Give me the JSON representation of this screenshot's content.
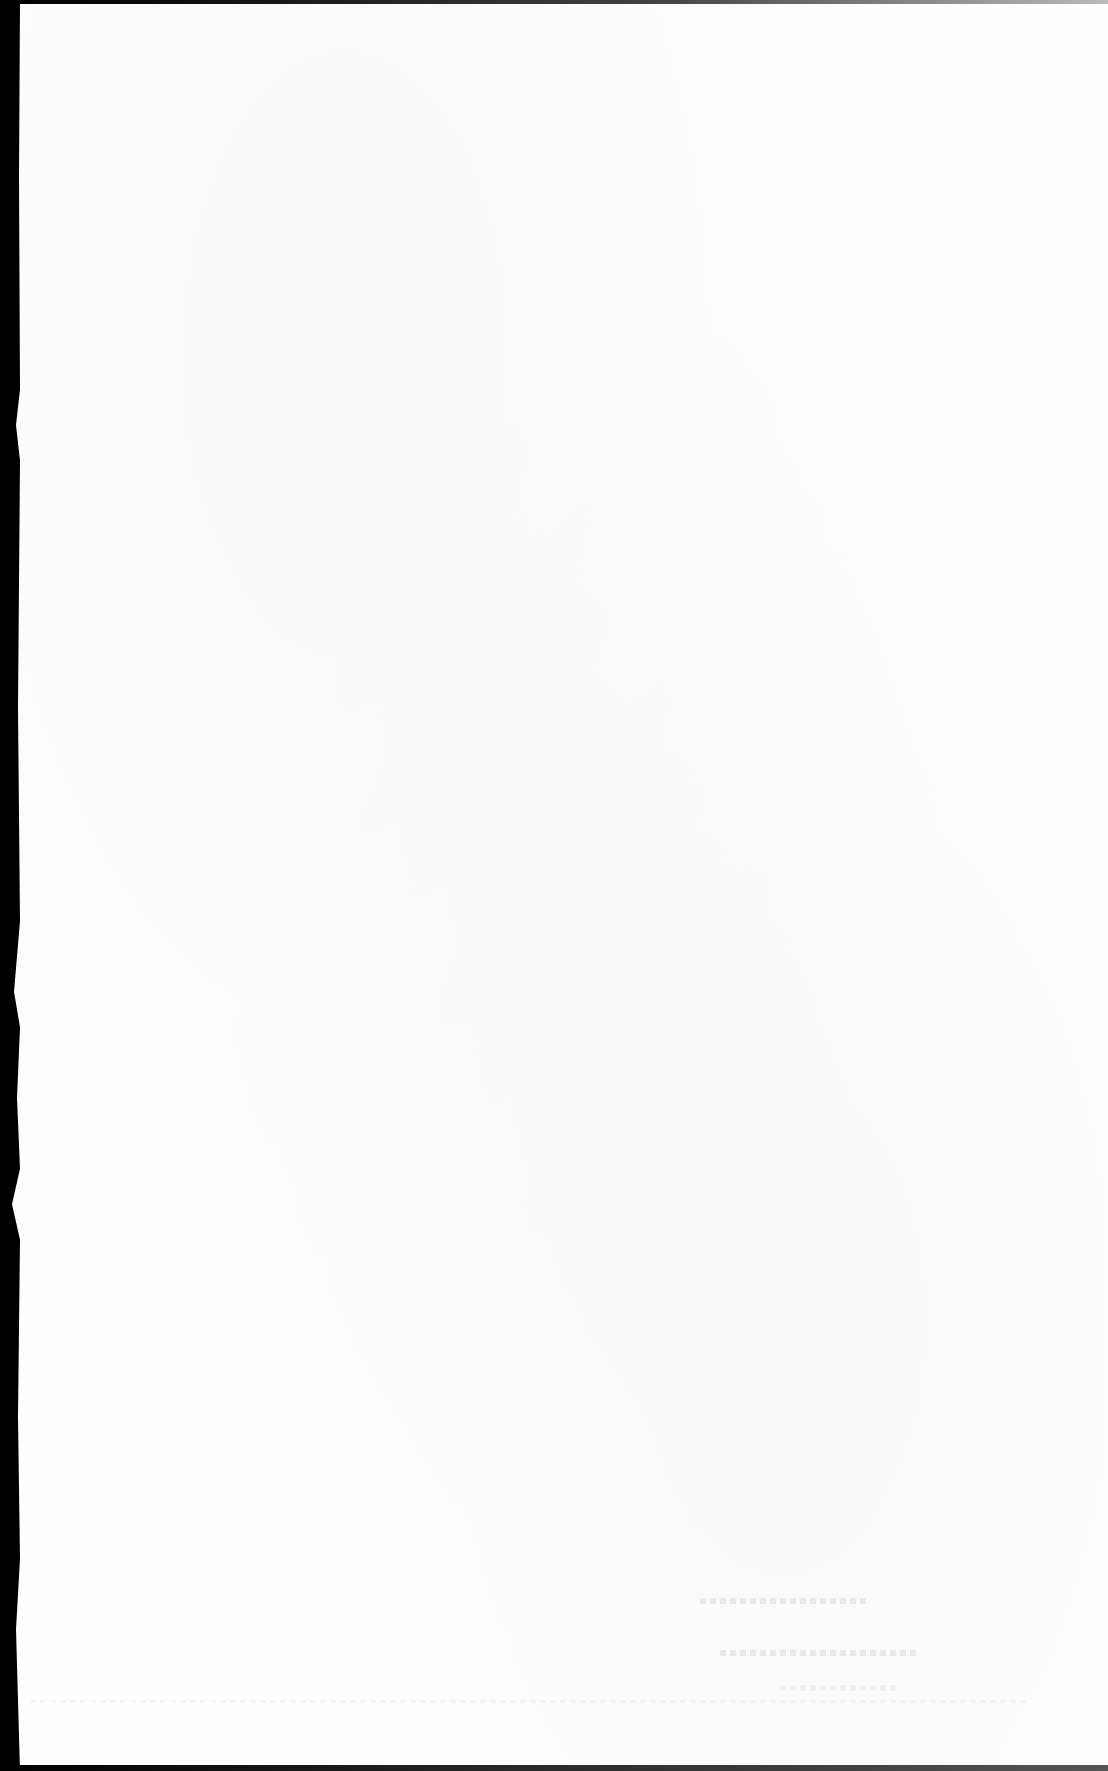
{
  "document": {
    "type": "scanned-page",
    "legible_text": "",
    "colors": {
      "paper": "#fefefe",
      "scanner_border": "#000000",
      "bleed_through": "#c8c8c8"
    }
  }
}
